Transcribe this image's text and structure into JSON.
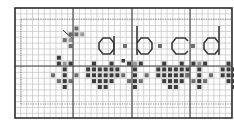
{
  "chart": {
    "title": "",
    "type": "cross-stitch-pattern",
    "cell_size": 5.85,
    "origin": {
      "x": 15,
      "y": 8
    },
    "cols": 37,
    "rows": 19,
    "bold_every": 10,
    "colors": {
      "background": "#ffffff",
      "grid_minor": "#c8c8c8",
      "grid_major": "#404040",
      "border": "#303030",
      "dotted": "#8a8a8a",
      "letter_stroke": "#3a3a3a",
      "stitch_dark": "#3c3c3c",
      "stitch_mid": "#6e6e6e",
      "stitch_light": "#9a9a9a"
    },
    "letters": [
      {
        "char": "a",
        "label": "a"
      },
      {
        "char": "b",
        "label": "b"
      },
      {
        "char": "c",
        "label": "c"
      },
      {
        "char": "d",
        "label": "d"
      }
    ],
    "separator_symbol": "·",
    "motif_band": {
      "sequence": [
        "cross",
        "heart",
        "cross",
        "heart",
        "cross",
        "heart"
      ],
      "motifs": {
        "cross": "light-gray diamond cross with dark center column",
        "heart": "dark heart shape"
      }
    }
  },
  "chart_data": {
    "type": "table",
    "title": "",
    "text_row": "a·b·c·d",
    "pattern_band": [
      "cross",
      "heart",
      "cross",
      "heart",
      "cross",
      "heart"
    ]
  }
}
